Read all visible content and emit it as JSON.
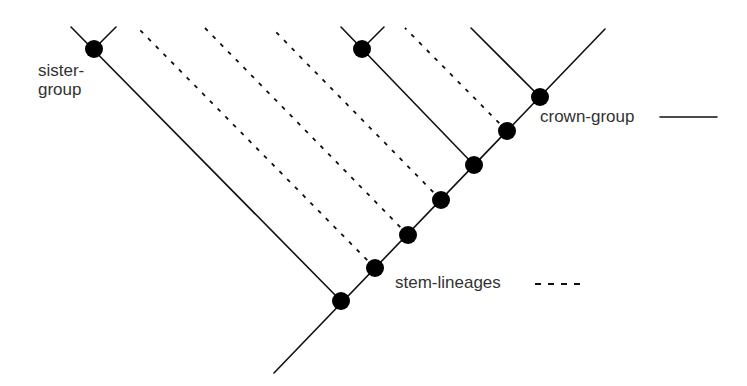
{
  "diagram": {
    "type": "cladogram",
    "labels": {
      "sister_line1": "sister-",
      "sister_line2": "group",
      "crown": "crown-group",
      "stem": "stem-lineages"
    },
    "legend": [
      {
        "label": "crown-group",
        "style": "solid"
      },
      {
        "label": "stem-lineages",
        "style": "dashed"
      }
    ],
    "colors": {
      "line": "#111111",
      "node": "#000000",
      "text": "#333333"
    }
  }
}
